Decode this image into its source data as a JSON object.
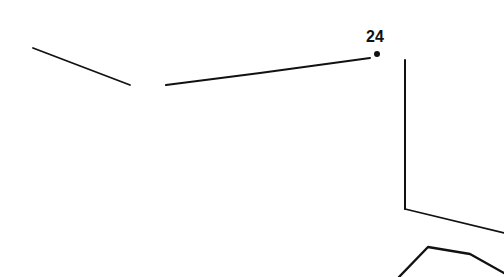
{
  "drawing": {
    "type": "connect-the-dots fragment",
    "stroke_color": "#111111",
    "background_color": "#ffffff",
    "dots": [
      {
        "label": "24",
        "x": 377,
        "y": 54,
        "label_x": 366,
        "label_y": 29
      }
    ],
    "strokes": [
      {
        "name": "left-diagonal-line",
        "points": "33,48 130,85",
        "width": 1.8
      },
      {
        "name": "upper-long-line",
        "points": "166,85 260,73 370,58",
        "width": 2
      },
      {
        "name": "vertical-line",
        "points": "405,60 405,209",
        "width": 2
      },
      {
        "name": "lower-diagonal-line",
        "points": "405,209 504,233",
        "width": 1.8
      },
      {
        "name": "bottom-curve",
        "points": "399,277 428,247 440,249 470,254 504,273",
        "width": 2.4
      }
    ]
  }
}
